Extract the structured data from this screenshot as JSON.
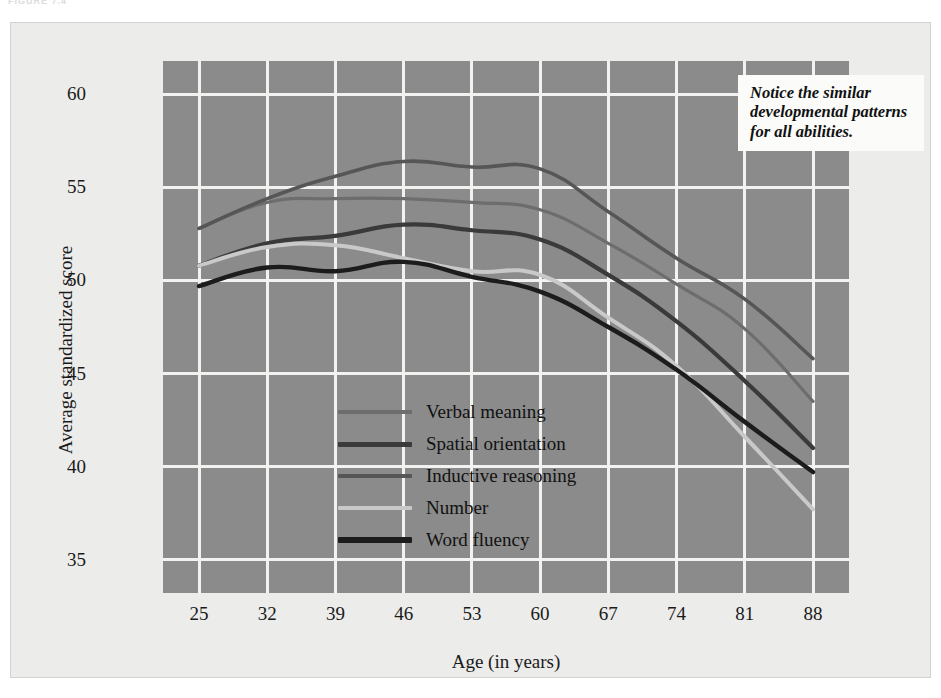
{
  "figure": {
    "header": "FIGURE 7.4",
    "annotation": "Notice the similar developmental patterns for all abilities."
  },
  "chart_data": {
    "type": "line",
    "title": "",
    "xlabel": "Age (in years)",
    "ylabel": "Average standardized score",
    "x": [
      25,
      32,
      39,
      46,
      53,
      60,
      67,
      74,
      81,
      88
    ],
    "xtick_labels": [
      "25",
      "32",
      "39",
      "46",
      "53",
      "60",
      "67",
      "74",
      "81",
      "88"
    ],
    "ytick_labels": [
      "35",
      "40",
      "45",
      "50",
      "55",
      "60"
    ],
    "yticks": [
      35,
      40,
      45,
      50,
      55,
      60
    ],
    "xlim": [
      25,
      88
    ],
    "ylim": [
      33.2,
      61.8
    ],
    "grid": true,
    "legend_position": "inside-lower-left",
    "plot_background": "#8b8b8b",
    "grid_color": "#f2f2f0",
    "series": [
      {
        "name": "Verbal meaning",
        "color": "#6d6d6d",
        "width": 3.2,
        "values": [
          52.8,
          54.2,
          54.4,
          54.4,
          54.2,
          53.8,
          52.0,
          49.8,
          47.4,
          43.5
        ]
      },
      {
        "name": "Spatial orientation",
        "color": "#3a3a3a",
        "width": 4.2,
        "values": [
          50.8,
          52.0,
          52.4,
          53.0,
          52.7,
          52.2,
          50.3,
          47.8,
          44.6,
          41.0
        ]
      },
      {
        "name": "Inductive reasoning",
        "color": "#565656",
        "width": 3.6,
        "values": [
          52.8,
          54.4,
          55.6,
          56.4,
          56.1,
          56.0,
          53.7,
          51.2,
          49.0,
          45.8
        ]
      },
      {
        "name": "Number",
        "color": "#c9c9c9",
        "width": 4.0,
        "values": [
          50.8,
          51.8,
          51.9,
          51.2,
          50.5,
          50.3,
          48.0,
          45.4,
          41.6,
          37.7
        ]
      },
      {
        "name": "Word fluency",
        "color": "#1c1c1c",
        "width": 4.4,
        "values": [
          49.7,
          50.7,
          50.5,
          51.0,
          50.2,
          49.4,
          47.5,
          45.2,
          42.4,
          39.7
        ]
      }
    ]
  }
}
